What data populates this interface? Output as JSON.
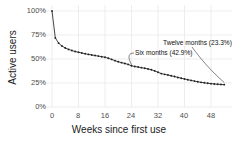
{
  "chart_data": {
    "type": "line",
    "title": "",
    "subtitle": "",
    "xlabel": "Weeks since first use",
    "ylabel": "Active users",
    "xlim": [
      0,
      54
    ],
    "ylim": [
      0,
      100
    ],
    "xticks": [
      0,
      8,
      16,
      24,
      32,
      40,
      48
    ],
    "xtick_labels": [
      "0",
      "8",
      "16",
      "24",
      "32",
      "40",
      "48"
    ],
    "yticks": [
      0,
      25,
      50,
      75,
      100
    ],
    "ytick_labels": [
      "0%",
      "25%",
      "50%",
      "75%",
      "100%"
    ],
    "grid": true,
    "legend": null,
    "marker": "dot",
    "line_color": "#222222",
    "grid_color": "#ebebeb",
    "background_color": "#ffffff",
    "x": [
      0,
      1,
      2,
      3,
      4,
      5,
      6,
      7,
      8,
      9,
      10,
      11,
      12,
      13,
      14,
      15,
      16,
      17,
      18,
      19,
      20,
      21,
      22,
      23,
      24,
      25,
      26,
      27,
      28,
      29,
      30,
      31,
      32,
      33,
      34,
      35,
      36,
      37,
      38,
      39,
      40,
      41,
      42,
      43,
      44,
      45,
      46,
      47,
      48,
      49,
      50,
      51,
      52
    ],
    "values": [
      100.0,
      72.0,
      66.5,
      63.5,
      61.5,
      60.0,
      58.8,
      57.8,
      57.0,
      56.2,
      55.5,
      54.8,
      54.2,
      53.6,
      53.0,
      52.4,
      51.8,
      50.8,
      49.6,
      48.3,
      47.2,
      46.2,
      45.3,
      44.4,
      42.9,
      42.2,
      41.6,
      41.0,
      40.3,
      39.6,
      38.8,
      37.6,
      36.2,
      34.8,
      34.0,
      33.3,
      32.5,
      31.7,
      30.8,
      30.0,
      29.2,
      28.4,
      27.7,
      27.0,
      26.3,
      25.7,
      25.2,
      24.7,
      24.3,
      24.0,
      23.7,
      23.5,
      23.3
    ],
    "annotations": [
      {
        "name": "six-months",
        "label": "Six months (42.9%)",
        "x": 24,
        "y": 42.9,
        "value_percent": "42.9%"
      },
      {
        "name": "twelve-months",
        "label": "Twelve months (23.3%)",
        "x": 52,
        "y": 23.3,
        "value_percent": "23.3%"
      }
    ]
  },
  "axes": {
    "x_title": "Weeks since first use",
    "y_title": "Active users",
    "x_tick_labels": [
      "0",
      "8",
      "16",
      "24",
      "32",
      "40",
      "48"
    ],
    "y_tick_labels": [
      "100%",
      "75%",
      "50%",
      "25%",
      "0%"
    ]
  },
  "annotations": {
    "six_months": "Six months (42.9%)",
    "twelve_months": "Twelve months (23.3%)"
  }
}
